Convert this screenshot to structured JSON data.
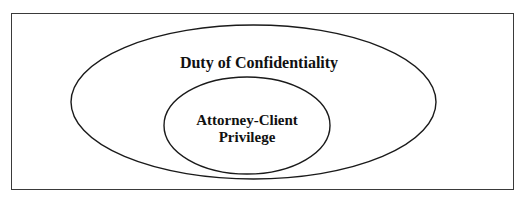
{
  "diagram": {
    "type": "nested-venn",
    "frame": {
      "border_color": "#3a3a3a",
      "background": "#ffffff"
    },
    "outer_set": {
      "label": "Duty of Confidentiality",
      "stroke": "#1a1a1a"
    },
    "inner_set": {
      "label_line1": "Attorney-Client",
      "label_line2": "Privilege",
      "stroke": "#1a1a1a"
    },
    "relationship": "Attorney-Client Privilege is a subset of Duty of Confidentiality"
  }
}
